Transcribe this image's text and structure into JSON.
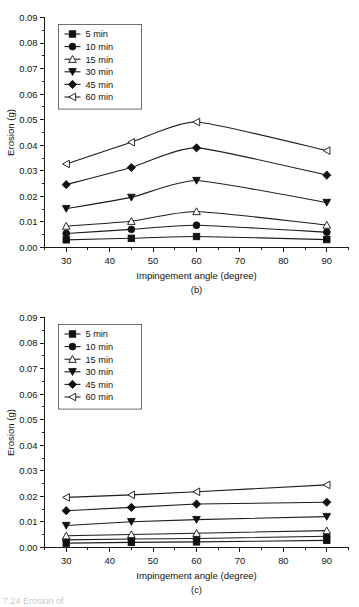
{
  "figure": {
    "cropped_caption_fragment": "7.24 Erosion of"
  },
  "chart_data": [
    {
      "type": "line",
      "panel": "b",
      "subcaption": "(b)",
      "title": "",
      "xlabel": "Impingement angle (degree)",
      "ylabel": "Erosion (g)",
      "xlim": [
        25,
        95
      ],
      "ylim": [
        0.0,
        0.09
      ],
      "xticks": [
        30,
        40,
        50,
        60,
        70,
        80,
        90
      ],
      "xticklabels": [
        "30",
        "40",
        "50",
        "60",
        "70",
        "80",
        "90"
      ],
      "yticks": [
        0.0,
        0.01,
        0.02,
        0.03,
        0.04,
        0.05,
        0.06,
        0.07,
        0.08,
        0.09
      ],
      "yticklabels": [
        "0.00",
        "0.01",
        "0.02",
        "0.03",
        "0.04",
        "0.05",
        "0.06",
        "0.07",
        "0.08",
        "0.09"
      ],
      "minor_ticks": true,
      "grid": false,
      "legend_position": "upper-left",
      "x": [
        30,
        45,
        60,
        90
      ],
      "series": [
        {
          "name": "5 min",
          "marker": "square-filled",
          "values": [
            0.003,
            0.0036,
            0.0043,
            0.0031
          ]
        },
        {
          "name": "10 min",
          "marker": "circle-filled",
          "values": [
            0.0055,
            0.0071,
            0.0087,
            0.006
          ]
        },
        {
          "name": "15 min",
          "marker": "triangle-up-open",
          "values": [
            0.0084,
            0.0103,
            0.0141,
            0.0088
          ]
        },
        {
          "name": "30 min",
          "marker": "triangle-down-filled",
          "values": [
            0.0152,
            0.0196,
            0.0262,
            0.0176
          ]
        },
        {
          "name": "45 min",
          "marker": "diamond-filled",
          "values": [
            0.0246,
            0.0313,
            0.039,
            0.0283
          ]
        },
        {
          "name": "60 min",
          "marker": "triangle-left-open",
          "values": [
            0.0327,
            0.0412,
            0.0491,
            0.0379
          ]
        }
      ]
    },
    {
      "type": "line",
      "panel": "c",
      "subcaption": "(c)",
      "title": "",
      "xlabel": "Impingement angle (degree)",
      "ylabel": "Erosion (g)",
      "xlim": [
        25,
        95
      ],
      "ylim": [
        0.0,
        0.09
      ],
      "xticks": [
        30,
        40,
        50,
        60,
        70,
        80,
        90
      ],
      "xticklabels": [
        "30",
        "40",
        "50",
        "60",
        "70",
        "80",
        "90"
      ],
      "yticks": [
        0.0,
        0.01,
        0.02,
        0.03,
        0.04,
        0.05,
        0.06,
        0.07,
        0.08,
        0.09
      ],
      "yticklabels": [
        "0.00",
        "0.01",
        "0.02",
        "0.03",
        "0.04",
        "0.05",
        "0.06",
        "0.07",
        "0.08",
        "0.09"
      ],
      "minor_ticks": true,
      "grid": false,
      "legend_position": "upper-left",
      "x": [
        30,
        45,
        60,
        90
      ],
      "series": [
        {
          "name": "5 min",
          "marker": "square-filled",
          "values": [
            0.0017,
            0.002,
            0.0022,
            0.0028
          ]
        },
        {
          "name": "10 min",
          "marker": "circle-filled",
          "values": [
            0.003,
            0.0033,
            0.0035,
            0.0044
          ]
        },
        {
          "name": "15 min",
          "marker": "triangle-up-open",
          "values": [
            0.0046,
            0.0051,
            0.0056,
            0.0066
          ]
        },
        {
          "name": "30 min",
          "marker": "triangle-down-filled",
          "values": [
            0.0086,
            0.0101,
            0.0109,
            0.0121
          ]
        },
        {
          "name": "45 min",
          "marker": "diamond-filled",
          "values": [
            0.0144,
            0.0157,
            0.017,
            0.0177
          ]
        },
        {
          "name": "60 min",
          "marker": "triangle-left-open",
          "values": [
            0.0196,
            0.0206,
            0.0218,
            0.0245
          ]
        }
      ]
    }
  ]
}
